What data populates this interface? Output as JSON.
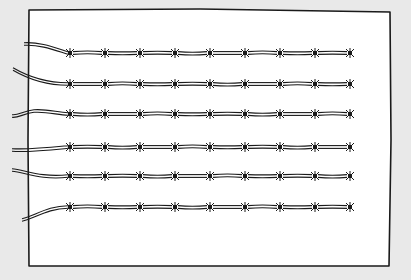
{
  "illustration": {
    "subject": "barbed wire strands on a sheet of paper",
    "colors": {
      "background": "#e9e9e9",
      "paper": "#ffffff",
      "ink": "#1a1a1a"
    },
    "strands": [
      {
        "id": 1,
        "barbs": 9,
        "tail": "curves-down-from-left"
      },
      {
        "id": 2,
        "barbs": 9,
        "tail": "steep-from-upper-left"
      },
      {
        "id": 3,
        "barbs": 9,
        "tail": "hooked-left"
      },
      {
        "id": 4,
        "barbs": 9,
        "tail": "rises-to-right"
      },
      {
        "id": 5,
        "barbs": 9,
        "tail": "dips-then-level"
      },
      {
        "id": 6,
        "barbs": 9,
        "tail": "rises-from-lower-left"
      }
    ]
  }
}
